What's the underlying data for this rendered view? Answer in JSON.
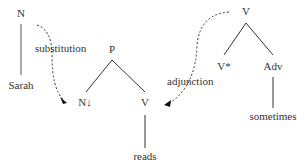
{
  "initial_tree_N": {
    "root": "N",
    "leaf": "Sarah"
  },
  "elementary_tree": {
    "root": "P",
    "left": "N↓",
    "right": "V",
    "leaf": "reads"
  },
  "auxiliary_tree": {
    "root": "V",
    "foot": "V*",
    "right": "Adv",
    "leaf": "sometimes"
  },
  "operations": {
    "substitution": "substitution",
    "adjunction": "adjunction"
  }
}
